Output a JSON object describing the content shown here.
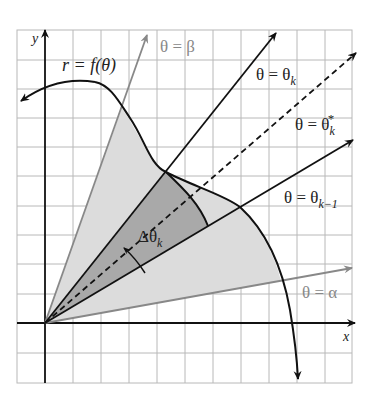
{
  "figure": {
    "axis_labels": {
      "x": "x",
      "y": "y"
    },
    "curve_label": "r = f(θ)",
    "ray_labels": {
      "beta": "θ = β",
      "theta_k": "θ = θ",
      "theta_k_sub": "k",
      "theta_k_star": "θ = θ",
      "theta_k_star_sub": "k",
      "theta_k_star_sup": "*",
      "theta_k_minus_1": "θ = θ",
      "theta_k_minus_1_sub": "k−1",
      "alpha": "θ = α"
    },
    "angle_label": "Δθ",
    "angle_label_sub": "k",
    "colors": {
      "grid": "#b8b8b8",
      "axis": "#111111",
      "gray_ray": "#8a8a8a",
      "light_fill": "#dcdcdc",
      "dark_fill": "#a9a9a9",
      "curve": "#111111"
    }
  }
}
